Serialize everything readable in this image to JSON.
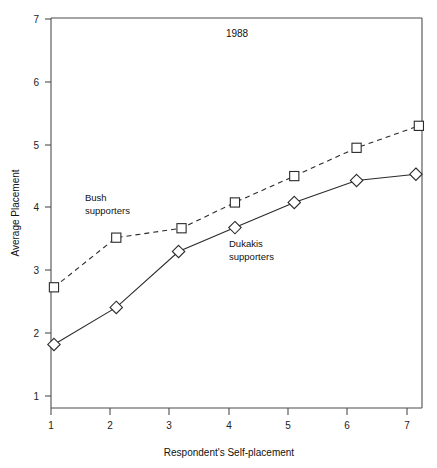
{
  "chart_data": {
    "type": "line",
    "title": "1988",
    "xlabel": "Respondent's Self-placement",
    "ylabel": "Average Placement",
    "xlim": [
      0.6,
      7.55
    ],
    "ylim": [
      0.72,
      7.05
    ],
    "xticks": [
      1,
      2,
      3,
      4,
      5,
      6,
      7
    ],
    "yticks": [
      1,
      2,
      3,
      4,
      5,
      6,
      7
    ],
    "xtick_labels": [
      "1",
      "2",
      "3",
      "4",
      "5",
      "6",
      "7"
    ],
    "ytick_labels": [
      "1",
      "2",
      "3",
      "4",
      "5",
      "6",
      "7"
    ],
    "grid": false,
    "legend": "inline-annotations",
    "series": [
      {
        "name": "Bush supporters",
        "marker": "square",
        "line_style": "dashed",
        "color": "#2a2a2a",
        "x": [
          1.05,
          2.1,
          3.2,
          4.1,
          5.1,
          6.15,
          7.2
        ],
        "values": [
          2.73,
          3.52,
          3.67,
          4.08,
          4.5,
          4.95,
          5.3
        ]
      },
      {
        "name": "Dukakis supporters",
        "marker": "diamond",
        "line_style": "solid",
        "color": "#2a2a2a",
        "x": [
          1.05,
          2.1,
          3.15,
          4.1,
          5.1,
          6.15,
          7.15
        ],
        "values": [
          1.82,
          2.41,
          3.3,
          3.68,
          4.08,
          4.43,
          4.53
        ]
      }
    ],
    "annotations": [
      {
        "text_line1": "Bush",
        "text_line2": "supporters",
        "x": 1.55,
        "y": 4.35
      },
      {
        "text_line1": "Dukakis",
        "text_line2": "supporters",
        "x": 3.95,
        "y": 3.32
      }
    ]
  },
  "labels": {
    "title": "1988",
    "x_axis_title": "Respondent's Self-placement",
    "y_axis_title": "Average Placement",
    "bush_line1": "Bush",
    "bush_line2": "supporters",
    "dukakis_line1": "Dukakis",
    "dukakis_line2": "supporters",
    "xtick_1": "1",
    "xtick_2": "2",
    "xtick_3": "3",
    "xtick_4": "4",
    "xtick_5": "5",
    "xtick_6": "6",
    "xtick_7": "7",
    "ytick_1": "1",
    "ytick_2": "2",
    "ytick_3": "3",
    "ytick_4": "4",
    "ytick_5": "5",
    "ytick_6": "6",
    "ytick_7": "7"
  }
}
